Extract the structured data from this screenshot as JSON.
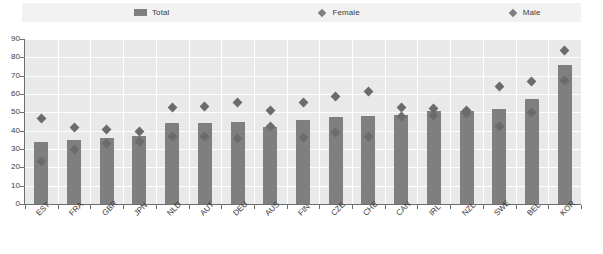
{
  "legend": {
    "items": [
      {
        "label": "Total",
        "marker": "bar-swatch",
        "color": "#7f7f7f"
      },
      {
        "label": "Female",
        "marker": "diamond",
        "color": "#7f7f7f"
      },
      {
        "label": "Male",
        "marker": "diamond",
        "color": "#7f7f7f"
      }
    ]
  },
  "chart_data": {
    "type": "bar",
    "title": "",
    "subtitle": "",
    "xlabel": "",
    "ylabel": "",
    "ylim": [
      0,
      90
    ],
    "yticks": [
      0,
      10,
      20,
      30,
      40,
      50,
      60,
      70,
      80,
      90
    ],
    "grid": true,
    "legend_position": "top",
    "categories": [
      "EST",
      "FRA",
      "GBR",
      "JPN",
      "NLD",
      "AUT",
      "DEU",
      "AUS",
      "FIN",
      "CZE",
      "CHE",
      "CAN",
      "IRL",
      "NZL",
      "SWE",
      "BEL",
      "KOR"
    ],
    "series": [
      {
        "name": "Total",
        "type": "bar",
        "color": "#7f7f7f",
        "values": [
          34,
          35,
          36,
          37,
          44,
          44,
          45,
          42,
          46,
          47.5,
          48,
          48.5,
          50.5,
          51,
          52,
          57.5,
          76
        ]
      },
      {
        "name": "Female",
        "type": "scatter",
        "color": "#6b6b6b",
        "values": [
          23,
          30,
          33,
          34,
          37,
          37,
          36,
          42.5,
          36.5,
          39,
          37,
          47.5,
          48.5,
          49.5,
          42.5,
          50,
          67.5
        ]
      },
      {
        "name": "Male",
        "type": "scatter",
        "color": "#6b6b6b",
        "values": [
          46.5,
          42,
          40.5,
          39.5,
          52.5,
          53,
          55.5,
          51,
          55.5,
          58.5,
          61.5,
          52.5,
          52,
          51,
          64,
          67,
          84
        ]
      }
    ]
  }
}
